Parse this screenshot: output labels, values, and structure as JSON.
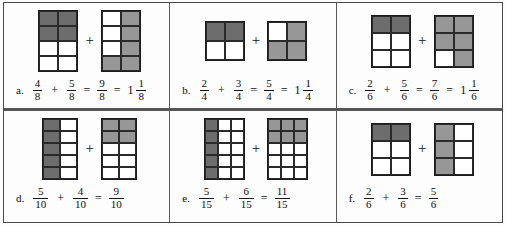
{
  "worksheet": {
    "title": "Fraction addition worksheet",
    "symbols": {
      "plus": "+",
      "equals": "="
    },
    "colors": {
      "shade_dark": "#6d6d6d",
      "shade_mid": "#979797",
      "cell_border": "#2a2a2a",
      "frame_border": "#4a4a4a",
      "background": "#fdfdfd",
      "text": "#0f0f0f"
    },
    "problems": [
      {
        "id": "a",
        "label": "a.",
        "model_1": {
          "cols": 2,
          "rows": 4,
          "total": 8,
          "shaded": 4,
          "shade_tone": "dark",
          "shaded_cells": [
            0,
            1,
            2,
            3
          ]
        },
        "model_2": {
          "cols": 2,
          "rows": 4,
          "total": 8,
          "shaded": 5,
          "shade_tone": "mid",
          "shaded_cells": [
            1,
            3,
            5,
            6,
            7
          ]
        },
        "addend_1": {
          "numerator": "4",
          "denominator": "8"
        },
        "addend_2": {
          "numerator": "5",
          "denominator": "8"
        },
        "sum": {
          "numerator": "9",
          "denominator": "8"
        },
        "mixed_number": {
          "whole": "1",
          "numerator": "1",
          "denominator": "8"
        },
        "has_mixed": true
      },
      {
        "id": "b",
        "label": "b.",
        "model_1": {
          "cols": 2,
          "rows": 2,
          "total": 4,
          "shaded": 2,
          "shade_tone": "dark",
          "shaded_cells": [
            0,
            1
          ]
        },
        "model_2": {
          "cols": 2,
          "rows": 2,
          "total": 4,
          "shaded": 3,
          "shade_tone": "mid",
          "shaded_cells": [
            1,
            2,
            3
          ]
        },
        "addend_1": {
          "numerator": "2",
          "denominator": "4"
        },
        "addend_2": {
          "numerator": "3",
          "denominator": "4"
        },
        "sum": {
          "numerator": "5",
          "denominator": "4"
        },
        "mixed_number": {
          "whole": "1",
          "numerator": "1",
          "denominator": "4"
        },
        "has_mixed": true
      },
      {
        "id": "c",
        "label": "c.",
        "model_1": {
          "cols": 2,
          "rows": 3,
          "total": 6,
          "shaded": 2,
          "shade_tone": "dark",
          "shaded_cells": [
            0,
            1
          ]
        },
        "model_2": {
          "cols": 2,
          "rows": 3,
          "total": 6,
          "shaded": 5,
          "shade_tone": "mid",
          "shaded_cells": [
            0,
            1,
            2,
            3,
            5
          ]
        },
        "addend_1": {
          "numerator": "2",
          "denominator": "6"
        },
        "addend_2": {
          "numerator": "5",
          "denominator": "6"
        },
        "sum": {
          "numerator": "7",
          "denominator": "6"
        },
        "mixed_number": {
          "whole": "1",
          "numerator": "1",
          "denominator": "6"
        },
        "has_mixed": true
      },
      {
        "id": "d",
        "label": "d.",
        "model_1": {
          "cols": 2,
          "rows": 5,
          "total": 10,
          "shaded": 5,
          "shade_tone": "dark",
          "shaded_cells": [
            0,
            2,
            4,
            6,
            8
          ]
        },
        "model_2": {
          "cols": 2,
          "rows": 5,
          "total": 10,
          "shaded": 4,
          "shade_tone": "mid",
          "shaded_cells": [
            0,
            1,
            2,
            3
          ]
        },
        "addend_1": {
          "numerator": "5",
          "denominator": "10"
        },
        "addend_2": {
          "numerator": "4",
          "denominator": "10"
        },
        "sum": {
          "numerator": "9",
          "denominator": "10"
        },
        "mixed_number": null,
        "has_mixed": false
      },
      {
        "id": "e",
        "label": "e.",
        "model_1": {
          "cols": 3,
          "rows": 5,
          "total": 15,
          "shaded": 5,
          "shade_tone": "dark",
          "shaded_cells": [
            0,
            3,
            6,
            9,
            12
          ]
        },
        "model_2": {
          "cols": 3,
          "rows": 5,
          "total": 15,
          "shaded": 6,
          "shade_tone": "mid",
          "shaded_cells": [
            0,
            1,
            2,
            3,
            4,
            5
          ]
        },
        "addend_1": {
          "numerator": "5",
          "denominator": "15"
        },
        "addend_2": {
          "numerator": "6",
          "denominator": "15"
        },
        "sum": {
          "numerator": "11",
          "denominator": "15"
        },
        "mixed_number": null,
        "has_mixed": false
      },
      {
        "id": "f",
        "label": "f.",
        "model_1": {
          "cols": 2,
          "rows": 3,
          "total": 6,
          "shaded": 2,
          "shade_tone": "dark",
          "shaded_cells": [
            0,
            1
          ]
        },
        "model_2": {
          "cols": 2,
          "rows": 3,
          "total": 6,
          "shaded": 3,
          "shade_tone": "mid",
          "shaded_cells": [
            0,
            2,
            4
          ]
        },
        "addend_1": {
          "numerator": "2",
          "denominator": "6"
        },
        "addend_2": {
          "numerator": "3",
          "denominator": "6"
        },
        "sum": {
          "numerator": "5",
          "denominator": "6"
        },
        "mixed_number": null,
        "has_mixed": false
      }
    ]
  }
}
